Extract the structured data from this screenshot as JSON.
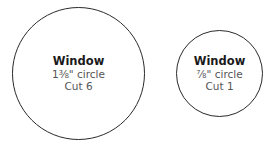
{
  "pieces": [
    {
      "name": "Window",
      "size": "1⅜\" circle",
      "cut": "Cut 6"
    },
    {
      "name": "Window",
      "size": "⅞\" circle",
      "cut": "Cut 1"
    }
  ]
}
